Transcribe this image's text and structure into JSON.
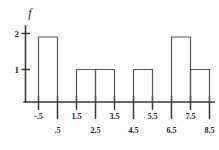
{
  "chart_data": {
    "type": "bar",
    "title": "",
    "subtitle": "",
    "xlabel": "",
    "ylabel": "f",
    "axis_label_y": "f",
    "grid": false,
    "legend": null,
    "bin_edges": [
      -0.5,
      0.5,
      1.5,
      2.5,
      3.5,
      4.5,
      5.5,
      6.5,
      7.5,
      8.5
    ],
    "tick_labels": [
      "-.5",
      ".5",
      "1.5",
      "2.5",
      "3.5",
      "4.5",
      "5.5",
      "6.5",
      "7.5",
      "8.5"
    ],
    "tick_label_rows": [
      "top",
      "bottom",
      "top",
      "bottom",
      "top",
      "bottom",
      "top",
      "bottom",
      "top",
      "bottom"
    ],
    "categories": [
      "-.5 to .5",
      ".5 to 1.5",
      "1.5 to 2.5",
      "2.5 to 3.5",
      "3.5 to 4.5",
      "4.5 to 5.5",
      "5.5 to 6.5",
      "6.5 to 7.5",
      "7.5 to 8.5"
    ],
    "values": [
      2,
      0,
      1,
      1,
      0,
      1,
      0,
      2,
      1
    ],
    "y_ticks": [
      1,
      2
    ],
    "y_tick_labels": [
      "1",
      "2"
    ],
    "ylim": [
      0,
      2.3
    ],
    "xlim": [
      -0.5,
      8.5
    ]
  },
  "colors": {
    "axis": "#3a3a3a",
    "bar_stroke": "#555555",
    "text": "#222222",
    "background": "#ffffff"
  }
}
